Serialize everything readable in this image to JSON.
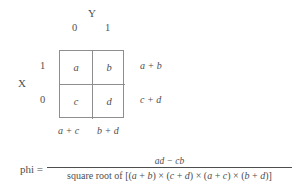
{
  "figure": {
    "title_var_y": "Y",
    "title_var_x": "X",
    "y_levels": [
      "0",
      "1"
    ],
    "x_levels": [
      "1",
      "0"
    ],
    "table": {
      "cells": [
        [
          "a",
          "b"
        ],
        [
          "c",
          "d"
        ]
      ],
      "row_sums": [
        "a + b",
        "c + d"
      ],
      "col_sums": [
        "a + c",
        "b + d"
      ]
    },
    "formula": {
      "lhs": "phi =",
      "numerator": "ad − cb",
      "denominator_prefix": "square root of [(",
      "denominator_full": "square root of [(a + b) × (c + d) × (a + c) × (b + d)]",
      "denominator_parts": {
        "lead": "square root of [(",
        "t1": "a",
        "p1": " + ",
        "t2": "b",
        "s1": ") × (",
        "t3": "c",
        "p2": " + ",
        "t4": "d",
        "s2": ") × (",
        "t5": "a",
        "p3": " + ",
        "t6": "c",
        "s3": ") × (",
        "t7": "b",
        "p4": " + ",
        "t8": "d",
        "tail": ")]"
      }
    },
    "colors": {
      "text": "#4e4e4e",
      "rule": "#8e8e8e",
      "background": "#ffffff"
    }
  }
}
